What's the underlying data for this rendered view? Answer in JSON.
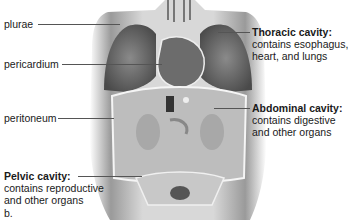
{
  "figure": {
    "subfigure_label": "b.",
    "left_labels": [
      {
        "text": "plurae"
      },
      {
        "text": "pericardium"
      },
      {
        "text": "peritoneum"
      }
    ],
    "right_labels": [
      {
        "title": "Thoracic cavity:",
        "desc1": "contains esophagus,",
        "desc2": "heart, and lungs"
      },
      {
        "title": "Abdominal cavity:",
        "desc1": "contains digestive",
        "desc2": "and other organs"
      }
    ],
    "bottom_left_label": {
      "title": "Pelvic cavity:",
      "desc1": "contains reproductive",
      "desc2": "and other organs"
    }
  }
}
